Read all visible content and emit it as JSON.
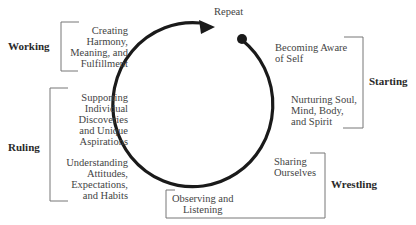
{
  "diagram": {
    "cycle_label": "Repeat",
    "phases": [
      {
        "name": "Starting",
        "items": [
          "Becoming Aware\nof Self",
          "Nurturing Soul,\nMind, Body,\nand Spirit"
        ]
      },
      {
        "name": "Wrestling",
        "items": [
          "Sharing\nOurselves",
          "Observing and\nListening"
        ]
      },
      {
        "name": "Ruling",
        "items": [
          "Supporting\nIndividual\nDiscoveries\nand Unique\nAspirations",
          "Understanding\nAttitudes,\nExpectations,\nand Habits"
        ]
      },
      {
        "name": "Working",
        "items": [
          "Creating\nHarmony,\nMeaning, and\nFulfillment"
        ]
      }
    ],
    "colors": {
      "stroke": "#1a1a1a",
      "bracket": "#777777",
      "text": "#444444"
    }
  }
}
